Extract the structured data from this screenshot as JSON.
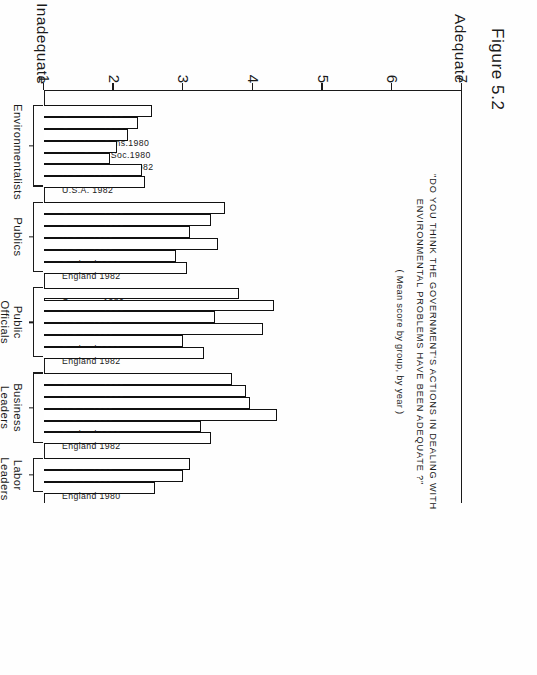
{
  "figure": {
    "label": "Figure 5.2"
  },
  "titles": {
    "line1": "\"DO YOU THINK THE GOVERNMENT'S ACTIONS IN DEALING WITH",
    "line2": "ENVIRONMENTAL  PROBLEMS  HAVE   BEEN   ADEQUATE ?\"",
    "subtitle": "( Mean score by group, by year )"
  },
  "axis": {
    "low_word": "Inadequate",
    "high_word": "Adequate",
    "ticks": [
      "7",
      "6",
      "5",
      "4",
      "3",
      "2",
      "1"
    ],
    "tick_values": [
      7,
      6,
      5,
      4,
      3,
      2,
      1
    ]
  },
  "chart_data": {
    "type": "bar",
    "orientation": "horizontal-rotated-page",
    "title": "\"DO YOU THINK THE GOVERNMENT'S ACTIONS IN DEALING WITH ENVIRONMENTAL PROBLEMS HAVE BEEN ADEQUATE ?\"",
    "subtitle": "( Mean score by group, by year )",
    "xlabel": "",
    "ylabel": "Mean score",
    "ylim": [
      1,
      7
    ],
    "y_low_label": "Inadequate 1",
    "y_high_label": "Adequate 7",
    "yticks": [
      1,
      2,
      3,
      4,
      5,
      6,
      7
    ],
    "grid": false,
    "legend": "none",
    "groups": [
      {
        "name": "Environmentalists",
        "name_lines": [
          "Environmentalists"
        ],
        "bars": [
          {
            "label": "Germany 1980",
            "value": 2.55
          },
          {
            "label": "Germany  1982",
            "value": 2.35
          },
          {
            "label": "U.K. Nat. Cons.1980",
            "value": 2.2
          },
          {
            "label": "U.K. Cons.  Soc.1980",
            "value": 2.05
          },
          {
            "label": "U.K. Cons.  Soc. 1982",
            "value": 1.95
          },
          {
            "label": "U.S.A. 1980",
            "value": 2.4
          },
          {
            "label": "U.S.A. 1982",
            "value": 2.45
          }
        ]
      },
      {
        "name": "Publics",
        "name_lines": [
          "Publics"
        ],
        "bars": [
          {
            "label": "Germany 1980",
            "value": 3.6
          },
          {
            "label": "Germany 1982",
            "value": 3.4
          },
          {
            "label": "U.S.A. 1980",
            "value": 3.1
          },
          {
            "label": "U.S.A. 1982",
            "value": 3.5
          },
          {
            "label": "England 1980",
            "value": 2.9
          },
          {
            "label": "England 1982",
            "value": 3.05
          }
        ]
      },
      {
        "name": "Public Officials",
        "name_lines": [
          "Public",
          "Officials"
        ],
        "bars": [
          {
            "label": "Germany 1980",
            "value": 3.8
          },
          {
            "label": "Germany 1982",
            "value": 4.3
          },
          {
            "label": "U.S.A. 1980",
            "value": 3.45
          },
          {
            "label": "U.S.A. 1982",
            "value": 4.15
          },
          {
            "label": "England 1980",
            "value": 3.0
          },
          {
            "label": "England 1982",
            "value": 3.3
          }
        ]
      },
      {
        "name": "Business Leaders",
        "name_lines": [
          "Business",
          "Leaders"
        ],
        "bars": [
          {
            "label": "Germany 1980",
            "value": 3.7
          },
          {
            "label": "Germany 1982",
            "value": 3.9
          },
          {
            "label": "U.S.A. 1980",
            "value": 3.95
          },
          {
            "label": "U.S.A. 1982",
            "value": 4.35
          },
          {
            "label": "England 1980",
            "value": 3.25
          },
          {
            "label": "England 1982",
            "value": 3.4
          }
        ]
      },
      {
        "name": "Labor Leaders",
        "name_lines": [
          "Labor",
          "Leaders"
        ],
        "bars": [
          {
            "label": "U.S.A. 1980",
            "value": 3.1
          },
          {
            "label": "U.S.A. 1982",
            "value": 3.0
          },
          {
            "label": "England 1980",
            "value": 2.6
          }
        ]
      }
    ]
  }
}
